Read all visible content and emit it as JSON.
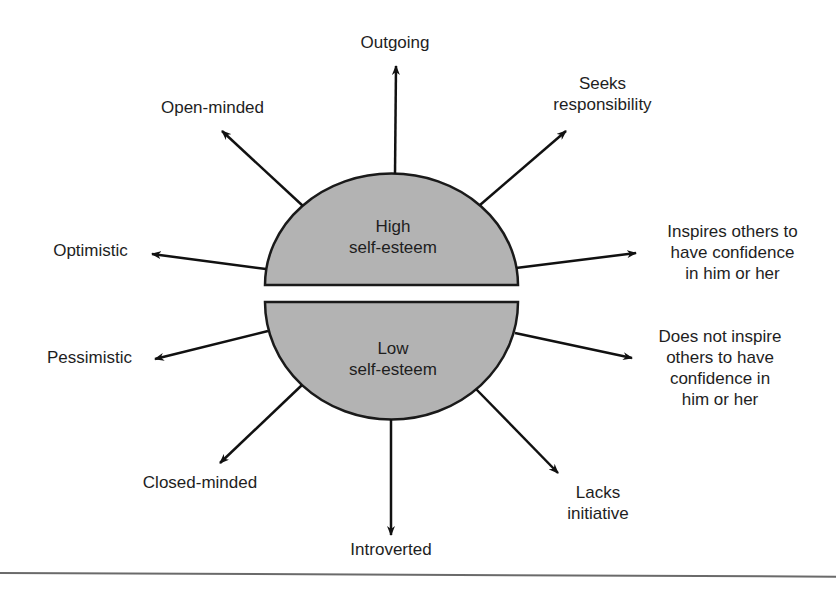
{
  "diagram": {
    "center": {
      "upper_label": "High\nself-esteem",
      "lower_label": "Low\nself-esteem",
      "fill": "#b3b3b3",
      "stroke": "#1a1a1a"
    },
    "high_traits": [
      {
        "label": "Outgoing"
      },
      {
        "label": "Seeks\nresponsibility"
      },
      {
        "label": "Inspires others to\nhave confidence\nin him or her"
      },
      {
        "label": "Optimistic"
      },
      {
        "label": "Open-minded"
      }
    ],
    "low_traits": [
      {
        "label": "Does not inspire\nothers to have\nconfidence in\nhim or her"
      },
      {
        "label": "Lacks\ninitiative"
      },
      {
        "label": "Introverted"
      },
      {
        "label": "Closed-minded"
      },
      {
        "label": "Pessimistic"
      }
    ]
  }
}
